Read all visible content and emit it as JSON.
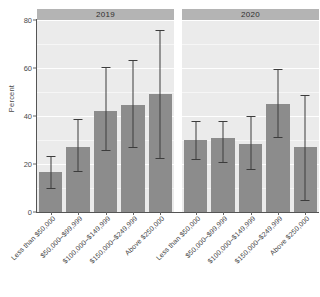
{
  "chart_data": {
    "type": "bar",
    "title": "",
    "xlabel": "",
    "ylabel": "Percent",
    "ylim": [
      0,
      80
    ],
    "yticks": [
      0,
      20,
      40,
      60,
      80
    ],
    "grid": true,
    "legend": "none",
    "error_bars": "vertical capped intervals",
    "facet_variable": "Year",
    "facets": [
      {
        "label": "2019",
        "categories": [
          "Less than $50,000",
          "$50,000–$99,999",
          "$100,000–$149,999",
          "$150,000–$249,999",
          "Above $250,000"
        ],
        "values": [
          16.5,
          27.0,
          42.0,
          44.5,
          49.0
        ],
        "err_low": [
          9.5,
          16.5,
          25.5,
          26.5,
          22.0
        ],
        "err_high": [
          23.0,
          38.5,
          60.0,
          63.0,
          75.5
        ]
      },
      {
        "label": "2020",
        "categories": [
          "Less than $50,000",
          "$50,000–$99,999",
          "$100,000–$149,999",
          "$150,000–$249,999",
          "Above $250,000"
        ],
        "values": [
          30.0,
          31.0,
          28.5,
          45.0,
          27.0
        ],
        "err_low": [
          21.5,
          20.5,
          17.5,
          31.0,
          4.5
        ],
        "err_high": [
          37.5,
          37.5,
          39.5,
          59.0,
          48.5
        ]
      }
    ],
    "colors": {
      "bar_fill": "#8c8c8c",
      "panel_background": "#ebebeb",
      "strip_background": "#b4b4b4",
      "gridline": "#ffffff",
      "error_bar": "#3c3c3c",
      "axis": "#555555",
      "text": "#3a3a3a"
    }
  }
}
